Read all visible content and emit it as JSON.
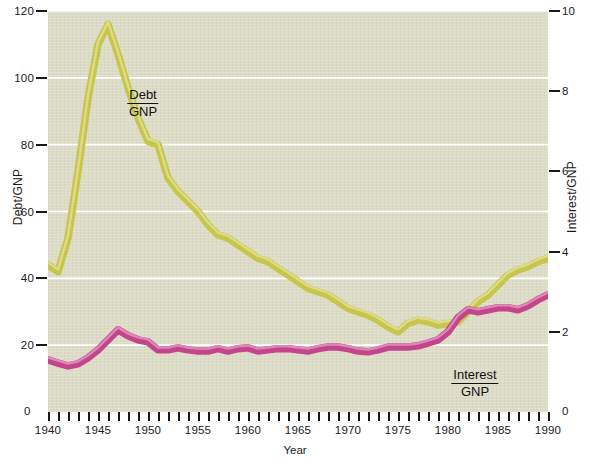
{
  "chart_data": {
    "type": "line",
    "title": "",
    "subtitle": "",
    "xlabel": "Year",
    "ylabel": "Debt/GNP",
    "ylabel_right": "Interest/GNP",
    "xlim": [
      1940,
      1990
    ],
    "ylim": [
      0,
      120
    ],
    "ylim_right": [
      0,
      10
    ],
    "grid": true,
    "legend_position": "inline-annotation",
    "x_tick_labels": [
      "1940",
      "1945",
      "1950",
      "1955",
      "1960",
      "1965",
      "1970",
      "1975",
      "1980",
      "1985",
      "1990"
    ],
    "x_tick_values": [
      1940,
      1945,
      1950,
      1955,
      1960,
      1965,
      1970,
      1975,
      1980,
      1985,
      1990
    ],
    "x_minor_tick_step": 1,
    "y_tick_labels_left": [
      "0",
      "20",
      "40",
      "60",
      "80",
      "100",
      "120"
    ],
    "y_tick_values_left": [
      0,
      20,
      40,
      60,
      80,
      100,
      120
    ],
    "y_tick_labels_right": [
      "0",
      "2",
      "4",
      "6",
      "8",
      "10"
    ],
    "y_tick_values_right": [
      0,
      2,
      4,
      6,
      8,
      10
    ],
    "x": [
      1940,
      1941,
      1942,
      1943,
      1944,
      1945,
      1946,
      1947,
      1948,
      1949,
      1950,
      1951,
      1952,
      1953,
      1954,
      1955,
      1956,
      1957,
      1958,
      1959,
      1960,
      1961,
      1962,
      1963,
      1964,
      1965,
      1966,
      1967,
      1968,
      1969,
      1970,
      1971,
      1972,
      1973,
      1974,
      1975,
      1976,
      1977,
      1978,
      1979,
      1980,
      1981,
      1982,
      1983,
      1984,
      1985,
      1986,
      1987,
      1988,
      1989,
      1990
    ],
    "series": [
      {
        "name": "Debt/GNP",
        "axis": "left",
        "color": "#c6c64a",
        "values": [
          44.0,
          42.0,
          52.0,
          72.0,
          94.0,
          110.0,
          116.0,
          107.0,
          97.0,
          88.0,
          81.0,
          80.0,
          70.0,
          66.0,
          63.0,
          60.0,
          56.0,
          53.0,
          52.0,
          50.0,
          48.0,
          46.0,
          45.0,
          43.0,
          41.0,
          39.0,
          37.0,
          36.0,
          35.0,
          33.0,
          31.0,
          30.0,
          29.0,
          27.5,
          25.5,
          24.0,
          26.5,
          27.5,
          27.0,
          26.0,
          26.5,
          27.0,
          30.0,
          33.0,
          35.0,
          38.0,
          41.0,
          42.5,
          43.5,
          45.0,
          46.0
        ]
      },
      {
        "name": "Interest/GNP",
        "axis": "right",
        "color": "#c5458c",
        "values": [
          1.3,
          1.22,
          1.15,
          1.2,
          1.35,
          1.55,
          1.8,
          2.05,
          1.9,
          1.8,
          1.75,
          1.55,
          1.55,
          1.6,
          1.55,
          1.52,
          1.52,
          1.58,
          1.52,
          1.58,
          1.6,
          1.52,
          1.55,
          1.58,
          1.58,
          1.55,
          1.52,
          1.58,
          1.62,
          1.62,
          1.58,
          1.52,
          1.5,
          1.55,
          1.62,
          1.62,
          1.62,
          1.65,
          1.72,
          1.8,
          2.0,
          2.35,
          2.55,
          2.5,
          2.55,
          2.6,
          2.6,
          2.55,
          2.65,
          2.8,
          2.92
        ]
      }
    ],
    "annotations": [
      {
        "id": "debt-annotation",
        "numerator": "Debt",
        "denominator": "GNP",
        "x_px": 143,
        "y_px": 88
      },
      {
        "id": "interest-annotation",
        "numerator": "Interest",
        "denominator": "GNP",
        "x_px": 475,
        "y_px": 368
      }
    ],
    "colors": {
      "plot_background": "#dcdcc6",
      "page_background": "#ffffff",
      "gridline": "#ffffff",
      "debt_line": "#c6c64a",
      "debt_line_highlight": "#dedc8e",
      "interest_line": "#c5458c",
      "interest_line_highlight": "#dd8cba",
      "text": "#1a1a1a"
    }
  },
  "axes": {
    "left": {
      "title": "Debt/GNP",
      "ticks": [
        {
          "label": "0",
          "value": 0
        },
        {
          "label": "20",
          "value": 20
        },
        {
          "label": "40",
          "value": 40
        },
        {
          "label": "60",
          "value": 60
        },
        {
          "label": "80",
          "value": 80
        },
        {
          "label": "100",
          "value": 100
        },
        {
          "label": "120",
          "value": 120
        }
      ]
    },
    "right": {
      "title": "Interest/GNP",
      "ticks": [
        {
          "label": "0",
          "value": 0
        },
        {
          "label": "2",
          "value": 2
        },
        {
          "label": "4",
          "value": 4
        },
        {
          "label": "6",
          "value": 6
        },
        {
          "label": "8",
          "value": 8
        },
        {
          "label": "10",
          "value": 10
        }
      ]
    },
    "bottom": {
      "title": "Year",
      "ticks": [
        {
          "label": "1940",
          "value": 1940
        },
        {
          "label": "1945",
          "value": 1945
        },
        {
          "label": "1950",
          "value": 1950
        },
        {
          "label": "1955",
          "value": 1955
        },
        {
          "label": "1960",
          "value": 1960
        },
        {
          "label": "1965",
          "value": 1965
        },
        {
          "label": "1970",
          "value": 1970
        },
        {
          "label": "1975",
          "value": 1975
        },
        {
          "label": "1980",
          "value": 1980
        },
        {
          "label": "1985",
          "value": 1985
        },
        {
          "label": "1990",
          "value": 1990
        }
      ]
    }
  },
  "zero_markers": {
    "left": "0",
    "right": "0"
  }
}
